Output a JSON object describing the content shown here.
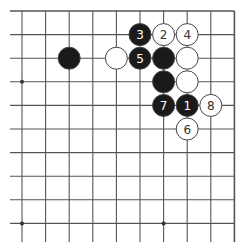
{
  "board": {
    "origin_x": 22,
    "origin_y": 11,
    "spacing": 23.6,
    "cols": 10,
    "rows": 10,
    "line_color": "#555555",
    "edges": {
      "top": true,
      "right": true,
      "left": false,
      "bottom": false
    },
    "star_points": [
      [
        0,
        3
      ],
      [
        0,
        9
      ],
      [
        6,
        9
      ]
    ]
  },
  "stones": [
    {
      "col": 2,
      "row": 2,
      "color": "black",
      "label": ""
    },
    {
      "col": 4,
      "row": 2,
      "color": "white",
      "label": ""
    },
    {
      "col": 5,
      "row": 1,
      "color": "black",
      "label": "3"
    },
    {
      "col": 6,
      "row": 1,
      "color": "white",
      "label": "2"
    },
    {
      "col": 7,
      "row": 1,
      "color": "white",
      "label": "4"
    },
    {
      "col": 5,
      "row": 2,
      "color": "black",
      "label": "5"
    },
    {
      "col": 6,
      "row": 2,
      "color": "black",
      "label": ""
    },
    {
      "col": 7,
      "row": 2,
      "color": "white",
      "label": ""
    },
    {
      "col": 6,
      "row": 3,
      "color": "black",
      "label": ""
    },
    {
      "col": 7,
      "row": 3,
      "color": "white",
      "label": ""
    },
    {
      "col": 6,
      "row": 4,
      "color": "black",
      "label": "7"
    },
    {
      "col": 7,
      "row": 4,
      "color": "black",
      "label": "1"
    },
    {
      "col": 8,
      "row": 4,
      "color": "white",
      "label": "8"
    },
    {
      "col": 7,
      "row": 5,
      "color": "white",
      "label": "6"
    }
  ],
  "colors": {
    "black_stone": "#1a1a1a",
    "white_stone": "#ffffff",
    "stone_outline": "#444444",
    "black_label": "#ffffff",
    "white_label": "#333333"
  }
}
